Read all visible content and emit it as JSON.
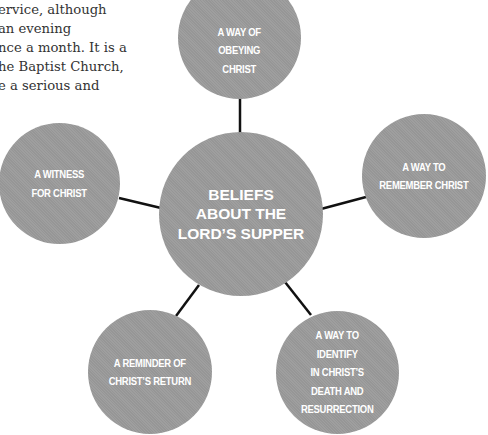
{
  "body_text": {
    "lines": [
      "ervice, although",
      "an evening",
      "nce a month. It is a",
      "he Baptist Church,",
      "e a serious and"
    ]
  },
  "diagram": {
    "center": {
      "lines": [
        "BELIEFS",
        "ABOUT THE",
        "LORD’S SUPPER"
      ]
    },
    "nodes": {
      "top": {
        "lines": [
          "A WAY OF",
          "OBEYING",
          "CHRIST"
        ]
      },
      "left": {
        "lines": [
          "A WITNESS",
          "FOR CHRIST"
        ]
      },
      "right": {
        "lines": [
          "A WAY TO",
          "REMEMBER CHRIST"
        ]
      },
      "bottom_left": {
        "lines": [
          "A REMINDER OF",
          "CHRIST’S RETURN"
        ]
      },
      "bottom_right": {
        "lines": [
          "A WAY TO",
          "IDENTIFY",
          "IN CHRIST’S",
          "DEATH AND",
          "RESURRECTION"
        ]
      }
    },
    "colors": {
      "circle_fill": "#9b9b9b",
      "circle_text": "#ffffff",
      "connector": "#111111",
      "body_text": "#333333"
    }
  }
}
